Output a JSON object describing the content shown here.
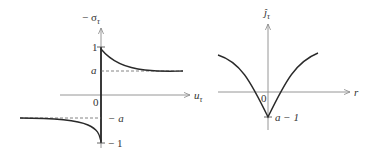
{
  "left_plot": {
    "y_axis_label": "− σ",
    "y_axis_label_sub": "τ",
    "x_axis_label": "u",
    "x_axis_label_sub": "τ",
    "origin_label": "0",
    "ticks": {
      "one": "1",
      "a": "a",
      "neg_a": "− a",
      "neg_one": "− 1"
    }
  },
  "right_plot": {
    "y_axis_label": "ĵ",
    "y_axis_label_sub": "τ",
    "x_axis_label": "r",
    "origin_label": "0",
    "min_label": "a − 1"
  },
  "colors": {
    "axis": "#8a8a8a",
    "curve": "#2a2a2a",
    "dashed": "#666666",
    "text": "#333333"
  }
}
